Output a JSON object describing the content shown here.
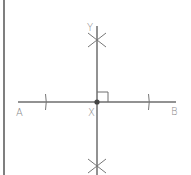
{
  "diagram": {
    "labels": {
      "point_a": "A",
      "point_b": "B",
      "point_x": "X",
      "point_y": "Y"
    },
    "colors": {
      "line": "#6e6e6e",
      "border": "#555555",
      "label": "#8a8a8a",
      "point": "#444444"
    },
    "elements": {
      "segment_ab": {
        "from": "A",
        "to": "B"
      },
      "perpendicular": {
        "through": "X",
        "toward": "Y"
      },
      "right_angle_marker": {
        "at": "X"
      },
      "arc_marks_on_ab": 2,
      "arc_intersections": 2
    }
  }
}
